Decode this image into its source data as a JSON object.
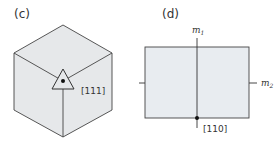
{
  "panels": [
    {
      "id": "c",
      "label": "(c)",
      "description": "Cube viewed along body diagonal with threefold axis",
      "direction_label": "[111]",
      "symmetry_symbol": "triangle (3-fold axis)"
    },
    {
      "id": "d",
      "label": "(d)",
      "description": "Rectangular cross-section with two mirror planes",
      "direction_label": "[110]",
      "mirror_labels": {
        "m1": "m",
        "m1_sub": "1",
        "m2": "m",
        "m2_sub": "2"
      }
    }
  ],
  "colors": {
    "face_fill": "#e6e8ea",
    "rect_fill": "#e8ecf0",
    "stroke": "#444444",
    "text": "#333333"
  }
}
